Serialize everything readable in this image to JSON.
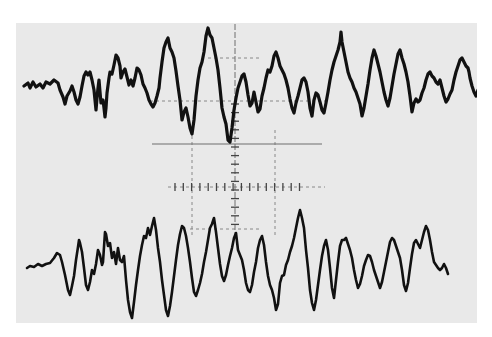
{
  "image": {
    "description": "Photograph of an oscilloscope screen showing two noisy oscillating waveform traces over a dashed graticule",
    "background_color": "#ffffff",
    "screen_color": "#e9e9e9",
    "trace_color": "#111111",
    "grid_color": "#6e6e6e"
  },
  "screen": {
    "x": 16,
    "y": 23,
    "width": 461,
    "height": 300
  },
  "graticule": {
    "center_x": 235,
    "verticals": [
      {
        "x": 192,
        "y1": 130,
        "y2": 235
      },
      {
        "x": 235,
        "y1": 24,
        "y2": 235
      },
      {
        "x": 275,
        "y1": 130,
        "y2": 235
      }
    ],
    "horizontals": [
      {
        "y": 58,
        "x1": 208,
        "x2": 262
      },
      {
        "y": 101,
        "x1": 150,
        "x2": 330
      },
      {
        "y": 144,
        "x1": 152,
        "x2": 322
      },
      {
        "y": 187,
        "x1": 168,
        "x2": 325
      },
      {
        "y": 229,
        "x1": 190,
        "x2": 262
      }
    ],
    "tick_rows_y": 187,
    "tick_cols_x": 235
  },
  "traces": {
    "upper": {
      "name": "upper-trace",
      "points": "24,86 28,83 30,88 33,82 36,87 40,84 43,88 46,82 50,84 54,80 58,83 60,90 63,97 65,104 67,96 70,91 72,86 74,92 76,100 78,104 80,97 82,86 84,76 86,72 88,75 90,72 92,80 94,90 95,100 96,110 97,98 98,88 99,80 100,92 101,103 103,100 104,108 105,117 106,108 107,93 109,78 110,72 112,74 114,65 116,55 118,58 120,66 121,78 123,72 125,69 127,77 129,85 131,80 133,86 135,78 137,68 139,70 141,75 143,84 145,88 147,93 149,100 151,104 153,107 155,103 157,96 159,88 160,78 162,62 164,48 166,42 168,38 170,48 172,52 174,58 176,71 178,86 180,100 181,110 182,120 184,112 186,108 188,117 190,128 192,134 194,120 196,96 198,80 200,68 202,62 204,52 206,36 208,28 210,35 212,38 214,48 216,58 218,70 220,88 222,108 224,117 226,124 228,140 230,142 232,128 234,110 236,98 238,88 240,82 242,76 244,74 246,82 248,95 250,106 252,103 254,92 256,102 258,112 260,109 262,96 264,88 266,78 268,70 270,72 272,66 274,56 276,52 278,58 280,66 282,70 284,74 286,80 288,88 290,99 292,108 294,113 296,103 298,96 300,88 302,80 304,78 306,82 308,92 310,108 312,116 314,100 316,93 318,95 320,102 322,110 324,113 326,103 328,92 330,80 332,70 334,62 336,56 338,50 340,42 341,32 342,42 344,52 346,62 348,72 350,78 352,82 354,88 356,92 358,98 360,104 362,116 364,108 366,96 368,84 370,70 372,58 374,50 376,56 378,64 380,72 382,82 384,92 386,100 388,106 390,98 392,86 394,74 396,64 398,54 400,50 402,58 404,64 406,72 408,82 410,96 412,112 414,103 416,99 418,102 420,100 422,93 424,88 426,80 428,74 430,72 432,76 434,78 436,82 438,84 440,80 442,88 444,96 446,102 448,99 450,94 452,90 454,80 456,72 458,66 460,60 462,58 464,62 466,66 468,68 469,72 470,78 472,86 474,92 476,96 478,90 480,92 482,86 484,88 486,82 488,78 490,76",
      "scale_note": "x coordinates beyond the screen are clipped by the screen border"
    },
    "lower": {
      "name": "lower-trace",
      "points": "27,268 30,266 34,267 38,264 42,266 46,264 50,263 54,258 57,253 60,255 62,262 65,275 68,290 70,295 72,286 74,276 76,260 78,247 79,240 80,243 82,252 84,268 86,285 88,290 90,282 92,270 94,274 96,264 98,250 100,255 102,265 103,262 105,232 106,234 108,246 110,243 112,258 114,252 116,264 118,248 120,260 122,262 124,256 126,280 128,300 130,312 132,318 134,302 136,285 138,270 140,256 142,245 144,236 146,238 148,228 150,235 152,226 154,218 156,230 158,248 160,262 162,280 164,295 166,310 168,316 170,306 172,292 174,276 176,260 178,245 180,234 182,226 184,228 186,236 188,248 190,262 192,278 194,292 196,296 198,290 200,283 202,274 204,262 206,252 208,240 210,228 212,224 214,218 216,232 218,248 220,264 222,276 224,281 226,275 228,265 230,256 232,248 234,238 236,233 238,250 240,255 242,260 244,270 246,283 248,290 250,292 252,285 254,272 256,262 258,248 260,240 262,236 264,245 266,262 268,276 270,285 272,290 274,298 276,310 278,304 280,283 282,276 284,275 286,265 288,260 290,252 292,246 294,238 296,228 298,218 300,210 302,218 304,228 306,250 308,268 310,290 312,303 314,310 316,300 318,285 320,270 322,256 324,246 326,240 328,250 330,268 332,288 334,298 336,280 338,262 340,246 342,240 344,240 346,238 348,244 350,250 352,258 354,270 356,280 358,288 360,284 362,276 364,266 366,260 368,255 370,256 372,262 374,270 376,276 378,282 380,288 382,282 384,272 386,262 388,252 390,242 392,238 394,240 396,246 398,252 400,258 402,270 404,285 406,291 408,283 410,268 412,254 414,243 416,240 418,244 420,248 422,240 424,232 426,226 428,230 430,240 432,252 434,262 436,265 438,268 440,270 442,268 444,264 446,268 448,274"
    }
  }
}
